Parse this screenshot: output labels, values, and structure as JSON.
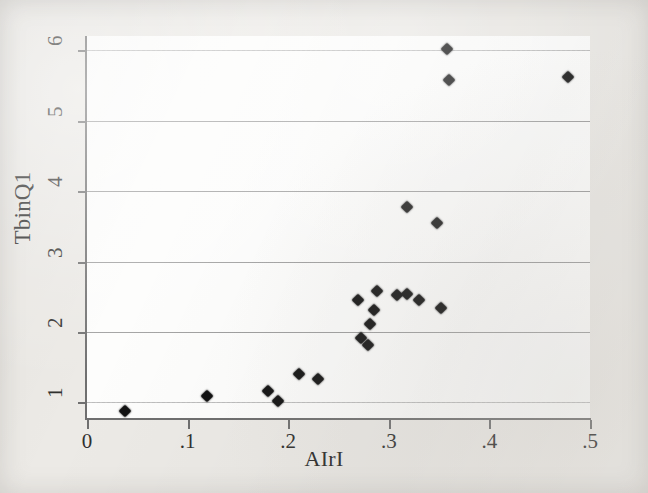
{
  "figure": {
    "background_color": "#eceae6",
    "plot_background_color": "#fdfdfc",
    "marker_color": "#121212",
    "gridline_color": "#8e8e8e",
    "axis_color": "#6f6f6f"
  },
  "chart_data": {
    "type": "scatter",
    "title": "",
    "xlabel": "AIrI",
    "ylabel": "TbinQ1",
    "xlim": [
      0,
      0.5
    ],
    "ylim": [
      0.78,
      6.2
    ],
    "xticks": [
      0,
      0.1,
      0.2,
      0.3,
      0.4,
      0.5
    ],
    "xticklabels": [
      "0",
      ".1",
      ".2",
      ".3",
      ".4",
      ".5"
    ],
    "yticks": [
      1,
      2,
      3,
      4,
      5,
      6
    ],
    "yticklabels": [
      "1",
      "2",
      "3",
      "4",
      "5",
      "6"
    ],
    "grid": "horizontal",
    "legend": "none",
    "marker": "diamond",
    "n_points": 21,
    "points": [
      {
        "x": 0.038,
        "y": 0.88
      },
      {
        "x": 0.119,
        "y": 1.09
      },
      {
        "x": 0.18,
        "y": 1.17
      },
      {
        "x": 0.19,
        "y": 1.02
      },
      {
        "x": 0.211,
        "y": 1.4
      },
      {
        "x": 0.23,
        "y": 1.34
      },
      {
        "x": 0.269,
        "y": 2.46
      },
      {
        "x": 0.272,
        "y": 1.92
      },
      {
        "x": 0.279,
        "y": 1.82
      },
      {
        "x": 0.281,
        "y": 2.11
      },
      {
        "x": 0.285,
        "y": 2.31
      },
      {
        "x": 0.288,
        "y": 2.58
      },
      {
        "x": 0.308,
        "y": 2.52
      },
      {
        "x": 0.318,
        "y": 2.54
      },
      {
        "x": 0.318,
        "y": 3.77
      },
      {
        "x": 0.33,
        "y": 2.45
      },
      {
        "x": 0.348,
        "y": 3.54
      },
      {
        "x": 0.352,
        "y": 2.34
      },
      {
        "x": 0.358,
        "y": 6.02
      },
      {
        "x": 0.36,
        "y": 5.57
      },
      {
        "x": 0.478,
        "y": 5.62
      }
    ]
  }
}
